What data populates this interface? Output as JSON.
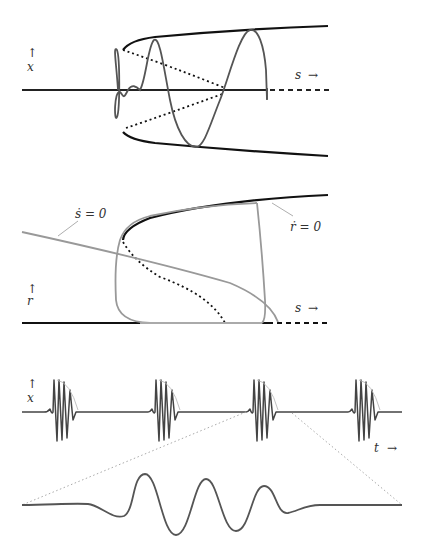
{
  "figure": {
    "panel1": {
      "y_label": "x",
      "y_arrow": "↑",
      "x_label": "s",
      "x_arrow": "→"
    },
    "panel2": {
      "y_label": "r",
      "y_arrow": "↑",
      "x_label": "s",
      "x_arrow": "→",
      "nullcline_s": "ṡ = 0",
      "nullcline_r": "ṙ = 0"
    },
    "panel3": {
      "y_label": "x",
      "y_arrow": "↑",
      "x_label": "t",
      "x_arrow": "→",
      "burst_count": 4
    },
    "colors": {
      "stable_branch": "#111111",
      "trajectory": "#555555",
      "nullcline": "#9a9a9a",
      "zoom_guide": "#aaaaaa"
    }
  }
}
